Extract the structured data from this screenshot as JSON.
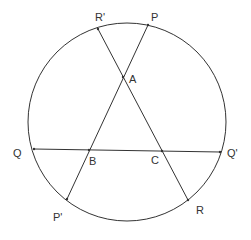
{
  "diagram": {
    "title": "",
    "colors": {
      "stroke": "#333333",
      "background": "#ffffff"
    },
    "circle": {
      "name": "circle"
    },
    "points": [
      {
        "id": "P",
        "label": "P"
      },
      {
        "id": "P'",
        "label": "P'"
      },
      {
        "id": "Q",
        "label": "Q"
      },
      {
        "id": "Q'",
        "label": "Q'"
      },
      {
        "id": "R",
        "label": "R"
      },
      {
        "id": "R'",
        "label": "R'"
      },
      {
        "id": "A",
        "label": "A"
      },
      {
        "id": "B",
        "label": "B"
      },
      {
        "id": "C",
        "label": "C"
      }
    ],
    "chords": [
      {
        "from": "P",
        "to": "P'",
        "passes_through": [
          "A",
          "B"
        ]
      },
      {
        "from": "R'",
        "to": "R",
        "passes_through": [
          "A",
          "C"
        ]
      },
      {
        "from": "Q",
        "to": "Q'",
        "passes_through": [
          "B",
          "C"
        ]
      }
    ],
    "intersections": [
      {
        "point": "A",
        "of": [
          "PP'",
          "R'R"
        ]
      },
      {
        "point": "B",
        "of": [
          "PP'",
          "QQ'"
        ]
      },
      {
        "point": "C",
        "of": [
          "R'R",
          "QQ'"
        ]
      }
    ]
  }
}
